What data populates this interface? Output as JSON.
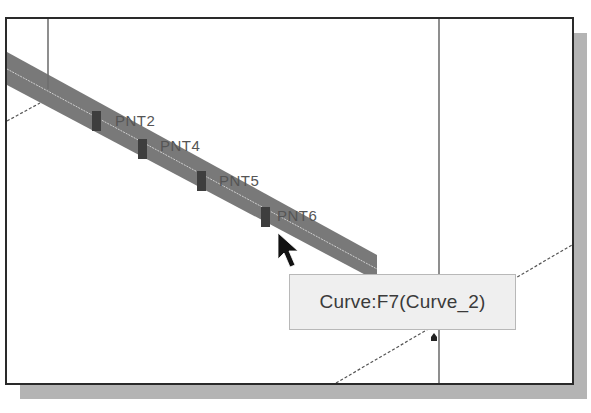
{
  "viewport": {
    "points": [
      {
        "label": "PNT2",
        "marker": [
          90,
          103
        ],
        "label_pos": [
          108,
          93
        ]
      },
      {
        "label": "PNT4",
        "marker": [
          136,
          131
        ],
        "label_pos": [
          153,
          118
        ]
      },
      {
        "label": "PNT5",
        "marker": [
          195,
          163
        ],
        "label_pos": [
          212,
          153
        ]
      },
      {
        "label": "PNT6",
        "marker": [
          259,
          199
        ],
        "label_pos": [
          270,
          188
        ]
      }
    ],
    "selected_curve": {
      "tooltip": "Curve:F7(Curve_2)"
    }
  },
  "colors": {
    "frame": "#2a2a2a",
    "shadow": "#b4b4b4",
    "band": "#6e6e6e",
    "tooltip_bg": "#efefef",
    "text": "#3a3a3a"
  }
}
